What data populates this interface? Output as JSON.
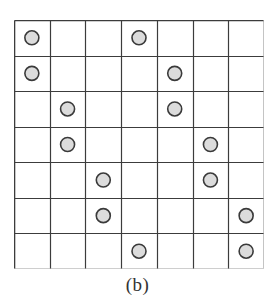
{
  "figure": {
    "caption": "(b)",
    "kind": "occupancy-grid-diagram"
  },
  "chart_data": {
    "type": "heatmap",
    "title": "(b)",
    "xlabel": "",
    "ylabel": "",
    "rows": 7,
    "cols": 7,
    "legend": [],
    "grid": true,
    "marker": {
      "shape": "circle",
      "fill": "#dcdcdc",
      "stroke": "#3a3a3a",
      "radius_px": 7,
      "name": "filled-cell-marker"
    },
    "cells": [
      [
        1,
        0,
        0,
        1,
        0,
        0,
        0
      ],
      [
        1,
        0,
        0,
        0,
        1,
        0,
        0
      ],
      [
        0,
        1,
        0,
        0,
        1,
        0,
        0
      ],
      [
        0,
        1,
        0,
        0,
        0,
        1,
        0
      ],
      [
        0,
        0,
        1,
        0,
        0,
        1,
        0
      ],
      [
        0,
        0,
        1,
        0,
        0,
        0,
        1
      ],
      [
        0,
        0,
        0,
        1,
        0,
        0,
        1
      ]
    ],
    "markers": [
      {
        "row": 1,
        "col": 1
      },
      {
        "row": 1,
        "col": 4
      },
      {
        "row": 2,
        "col": 1
      },
      {
        "row": 2,
        "col": 5
      },
      {
        "row": 3,
        "col": 2
      },
      {
        "row": 3,
        "col": 5
      },
      {
        "row": 4,
        "col": 2
      },
      {
        "row": 4,
        "col": 6
      },
      {
        "row": 5,
        "col": 3
      },
      {
        "row": 5,
        "col": 6
      },
      {
        "row": 6,
        "col": 3
      },
      {
        "row": 6,
        "col": 7
      },
      {
        "row": 7,
        "col": 4
      },
      {
        "row": 7,
        "col": 7
      }
    ],
    "marker_count": 14
  },
  "colors": {
    "background": "#ffffff",
    "grid_line": "#3c3c3c",
    "marker_fill": "#dcdcdc",
    "marker_stroke": "#3a3a3a",
    "caption_text": "#333333"
  }
}
